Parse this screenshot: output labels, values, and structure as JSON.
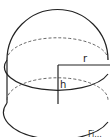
{
  "figure": {
    "labels": {
      "radius": "r",
      "height": "h"
    },
    "caption_partial": "Fi..."
  }
}
